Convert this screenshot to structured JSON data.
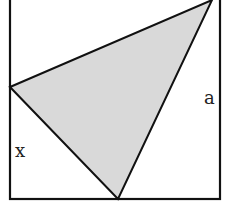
{
  "diagram": {
    "type": "geometry",
    "labels": {
      "side": "a",
      "segment": "x"
    },
    "colors": {
      "stroke": "#111111",
      "fill": "#d9d9d9",
      "background": "#ffffff"
    },
    "square": {
      "x": 10,
      "y": 0,
      "width": 210,
      "height": 199
    },
    "triangle": {
      "points": [
        [
          10,
          87
        ],
        [
          212,
          0
        ],
        [
          118,
          199
        ]
      ]
    }
  }
}
